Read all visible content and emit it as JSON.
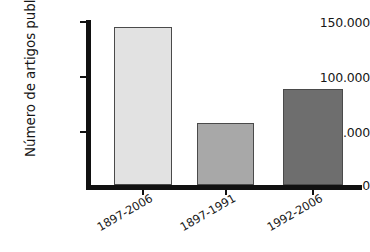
{
  "chart_data": {
    "type": "bar",
    "title": "",
    "xlabel": "",
    "ylabel": "Número de artigos publicados",
    "categories": [
      "1897-2006",
      "1897-1991",
      "1992-2006"
    ],
    "values": [
      145000,
      57000,
      88000
    ],
    "value_labels": [
      "145.000",
      "57.000",
      "88.000"
    ],
    "ytick_labels": [
      "0",
      "50.000",
      "100.000",
      "150.000"
    ],
    "ytick_values": [
      0,
      50000,
      100000,
      150000
    ],
    "ylim": [
      0,
      150000
    ],
    "grid": false,
    "legend": "none",
    "bar_colors": [
      "#e2e2e2",
      "#a8a8a8",
      "#6e6e6e"
    ],
    "bar_outline_color": "#4a4a4a",
    "axis_color": "#111111",
    "background_color": "#ffffff",
    "xlabel_rotation_deg": -30,
    "ylabel_rotation_deg": -90
  },
  "axis": {
    "y_title": "Número de artigos publicados",
    "ticks": [
      {
        "label": "150.000",
        "value": 150000
      },
      {
        "label": "100.000",
        "value": 100000
      },
      {
        "label": "50.000",
        "value": 50000
      },
      {
        "label": "0",
        "value": 0
      }
    ]
  },
  "bars": [
    {
      "category": "1897-2006",
      "value": 145000,
      "color": "#e2e2e2"
    },
    {
      "category": "1897-1991",
      "value": 57000,
      "color": "#a8a8a8"
    },
    {
      "category": "1992-2006",
      "value": 88000,
      "color": "#6e6e6e"
    }
  ]
}
